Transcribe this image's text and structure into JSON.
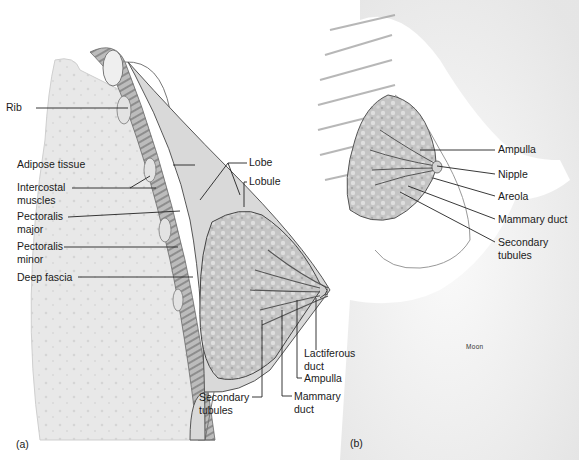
{
  "figure": {
    "panels": [
      {
        "id": "a",
        "label": "(a)"
      },
      {
        "id": "b",
        "label": "(b)"
      }
    ],
    "signature": "Moon",
    "colors": {
      "background": "#ffffff",
      "rib_cage_fill": "#e9e9e9",
      "muscle_dark": "#8a8a8a",
      "gland_fill": "#bdbdbd",
      "skin_shade": "#d8d8d8",
      "line": "#222222"
    }
  },
  "panel_a": {
    "labels": {
      "rib": "Rib",
      "adipose": "Adipose tissue",
      "intercostal": "Intercostal\nmuscles",
      "pect_major": "Pectoralis\nmajor",
      "pect_minor": "Pectoralis\nminor",
      "deep_fascia": "Deep fascia",
      "lobe": "Lobe",
      "lobule": "Lobule",
      "lactiferous": "Lactiferous\nduct",
      "ampulla": "Ampulla",
      "mammary_duct": "Mammary\nduct",
      "secondary": "Secondary\ntubules"
    }
  },
  "panel_b": {
    "labels": {
      "ampulla": "Ampulla",
      "nipple": "Nipple",
      "areola": "Areola",
      "mammary_duct": "Mammary duct",
      "secondary": "Secondary\ntubules"
    }
  }
}
